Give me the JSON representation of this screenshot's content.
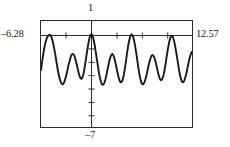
{
  "chart_data": {
    "type": "line",
    "title": "",
    "xlabel": "",
    "ylabel": "",
    "xlim": [
      -6.28,
      12.57
    ],
    "ylim": [
      -7,
      1
    ],
    "grid": false,
    "legend": null,
    "axis_labels": {
      "x_min": "–6.28",
      "x_max": "12.57",
      "y_max": "1",
      "y_min": "–7"
    },
    "style": "graphing-calculator-window",
    "x_ticks": [
      -6.28,
      -3.14,
      0,
      3.14,
      6.28,
      9.42,
      12.57
    ],
    "y_ticks": [
      -7,
      -6,
      -5,
      -4,
      -3,
      -2,
      -1,
      0,
      1
    ],
    "series": [
      {
        "name": "curve",
        "color": "#1a1a1a",
        "points": [
          [
            -6.28,
            -2.7
          ],
          [
            -6.1,
            -1.9
          ],
          [
            -5.9,
            -1.15
          ],
          [
            -5.7,
            -0.58
          ],
          [
            -5.5,
            -0.22
          ],
          [
            -5.3,
            -0.07
          ],
          [
            -5.15,
            -0.05
          ],
          [
            -5.0,
            -0.18
          ],
          [
            -4.8,
            -0.58
          ],
          [
            -4.6,
            -1.18
          ],
          [
            -4.4,
            -1.9
          ],
          [
            -4.2,
            -2.62
          ],
          [
            -4.0,
            -3.22
          ],
          [
            -3.8,
            -3.62
          ],
          [
            -3.62,
            -3.78
          ],
          [
            -3.45,
            -3.7
          ],
          [
            -3.25,
            -3.38
          ],
          [
            -3.05,
            -2.9
          ],
          [
            -2.85,
            -2.35
          ],
          [
            -2.65,
            -1.88
          ],
          [
            -2.48,
            -1.58
          ],
          [
            -2.32,
            -1.48
          ],
          [
            -2.15,
            -1.58
          ],
          [
            -1.98,
            -1.88
          ],
          [
            -1.8,
            -2.32
          ],
          [
            -1.62,
            -2.8
          ],
          [
            -1.45,
            -3.18
          ],
          [
            -1.28,
            -3.36
          ],
          [
            -1.12,
            -3.28
          ],
          [
            -0.95,
            -2.92
          ],
          [
            -0.78,
            -2.32
          ],
          [
            -0.6,
            -1.58
          ],
          [
            -0.42,
            -0.88
          ],
          [
            -0.25,
            -0.35
          ],
          [
            -0.1,
            -0.06
          ],
          [
            0.05,
            -0.02
          ],
          [
            0.22,
            -0.25
          ],
          [
            0.4,
            -0.75
          ],
          [
            0.58,
            -1.45
          ],
          [
            0.78,
            -2.22
          ],
          [
            0.96,
            -2.92
          ],
          [
            1.14,
            -3.45
          ],
          [
            1.32,
            -3.75
          ],
          [
            1.5,
            -3.8
          ],
          [
            1.68,
            -3.58
          ],
          [
            1.86,
            -3.15
          ],
          [
            2.04,
            -2.62
          ],
          [
            2.22,
            -2.1
          ],
          [
            2.4,
            -1.7
          ],
          [
            2.56,
            -1.5
          ],
          [
            2.72,
            -1.55
          ],
          [
            2.88,
            -1.82
          ],
          [
            3.06,
            -2.28
          ],
          [
            3.24,
            -2.8
          ],
          [
            3.42,
            -3.28
          ],
          [
            3.6,
            -3.58
          ],
          [
            3.78,
            -3.6
          ],
          [
            3.96,
            -3.32
          ],
          [
            4.14,
            -2.78
          ],
          [
            4.32,
            -2.05
          ],
          [
            4.5,
            -1.28
          ],
          [
            4.68,
            -0.62
          ],
          [
            4.86,
            -0.18
          ],
          [
            5.02,
            -0.02
          ],
          [
            5.18,
            -0.12
          ],
          [
            5.36,
            -0.52
          ],
          [
            5.54,
            -1.15
          ],
          [
            5.74,
            -1.95
          ],
          [
            5.92,
            -2.7
          ],
          [
            6.1,
            -3.3
          ],
          [
            6.28,
            -3.68
          ],
          [
            6.46,
            -3.78
          ],
          [
            6.64,
            -3.62
          ],
          [
            6.82,
            -3.25
          ],
          [
            7.0,
            -2.78
          ],
          [
            7.18,
            -2.28
          ],
          [
            7.36,
            -1.88
          ],
          [
            7.52,
            -1.62
          ],
          [
            7.68,
            -1.58
          ],
          [
            7.86,
            -1.75
          ],
          [
            8.04,
            -2.12
          ],
          [
            8.22,
            -2.6
          ],
          [
            8.4,
            -3.05
          ],
          [
            8.58,
            -3.38
          ],
          [
            8.76,
            -3.45
          ],
          [
            8.94,
            -3.25
          ],
          [
            9.12,
            -2.78
          ],
          [
            9.3,
            -2.12
          ],
          [
            9.48,
            -1.4
          ],
          [
            9.66,
            -0.78
          ],
          [
            9.84,
            -0.32
          ],
          [
            10.0,
            -0.12
          ],
          [
            10.16,
            -0.18
          ],
          [
            10.34,
            -0.52
          ],
          [
            10.52,
            -1.08
          ],
          [
            10.72,
            -1.8
          ],
          [
            10.9,
            -2.5
          ],
          [
            11.08,
            -3.1
          ],
          [
            11.26,
            -3.5
          ],
          [
            11.44,
            -3.62
          ],
          [
            11.62,
            -3.48
          ],
          [
            11.8,
            -3.12
          ],
          [
            11.98,
            -2.62
          ],
          [
            12.16,
            -2.1
          ],
          [
            12.34,
            -1.65
          ],
          [
            12.5,
            -1.38
          ],
          [
            12.57,
            -1.32
          ]
        ]
      }
    ]
  }
}
